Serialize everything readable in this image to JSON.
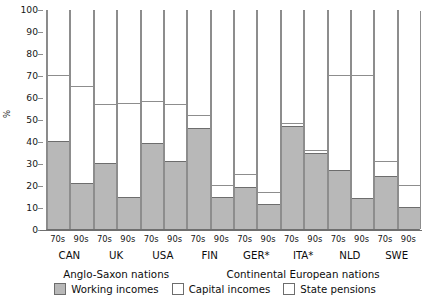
{
  "chart_data": {
    "type": "bar",
    "title": "",
    "xlabel": "",
    "ylabel": "%",
    "ylim": [
      0,
      100
    ],
    "ytick_step": 10,
    "yticks": [
      0,
      10,
      20,
      30,
      40,
      50,
      60,
      70,
      80,
      90,
      100
    ],
    "grid": false,
    "stacked": true,
    "legend_position": "bottom",
    "legend": [
      {
        "label": "Working incomes",
        "fill": "#b8b8b8"
      },
      {
        "label": "Capital incomes",
        "fill": "#ffffff"
      },
      {
        "label": "State pensions",
        "fill": "#ffffff"
      }
    ],
    "series": [
      {
        "name": "Working incomes",
        "values": [
          40,
          21,
          30,
          14.5,
          39,
          31,
          46,
          14.5,
          19,
          11.5,
          47,
          34.5,
          27,
          14,
          24,
          10
        ]
      },
      {
        "name": "Capital incomes",
        "values": [
          30,
          44,
          27,
          43,
          19,
          26,
          6,
          5.5,
          6,
          5.5,
          1,
          1.5,
          43,
          56,
          7,
          10
        ]
      },
      {
        "name": "State pensions",
        "values": [
          30,
          35,
          43,
          42.5,
          42,
          43,
          48,
          80,
          75,
          83,
          52,
          64,
          30,
          30,
          69,
          80
        ]
      }
    ],
    "x": [
      {
        "period": "70s",
        "country": "CAN"
      },
      {
        "period": "90s",
        "country": "CAN"
      },
      {
        "period": "70s",
        "country": "UK"
      },
      {
        "period": "90s",
        "country": "UK"
      },
      {
        "period": "70s",
        "country": "USA"
      },
      {
        "period": "90s",
        "country": "USA"
      },
      {
        "period": "70s",
        "country": "FIN"
      },
      {
        "period": "90s",
        "country": "FIN"
      },
      {
        "period": "70s",
        "country": "GER*"
      },
      {
        "period": "90s",
        "country": "GER*"
      },
      {
        "period": "70s",
        "country": "ITA*"
      },
      {
        "period": "90s",
        "country": "ITA*"
      },
      {
        "period": "70s",
        "country": "NLD"
      },
      {
        "period": "90s",
        "country": "NLD"
      },
      {
        "period": "70s",
        "country": "SWE"
      },
      {
        "period": "90s",
        "country": "SWE"
      }
    ],
    "countries": [
      "CAN",
      "UK",
      "USA",
      "FIN",
      "GER*",
      "ITA*",
      "NLD",
      "SWE"
    ],
    "bands": [
      {
        "label": "Anglo-Saxon nations",
        "countries": [
          "CAN",
          "UK",
          "USA"
        ]
      },
      {
        "label": "Continental European nations",
        "countries": [
          "FIN",
          "GER*",
          "ITA*",
          "NLD",
          "SWE"
        ]
      }
    ],
    "colors": {
      "working": "#b8b8b8",
      "capital": "#ffffff",
      "pension": "#ffffff",
      "axis": "#8a8a8a",
      "outline": "#6d6d6d"
    }
  }
}
